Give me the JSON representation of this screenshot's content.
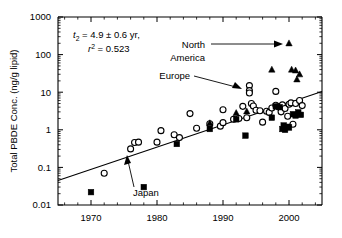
{
  "chart_data": {
    "type": "scatter",
    "title": "",
    "xlabel": "",
    "ylabel": "Total PBDE Conc. (ng/g lipid)",
    "xlim": [
      1965,
      2005
    ],
    "ylim": [
      0.01,
      1000
    ],
    "yscale": "log",
    "grid": false,
    "legend_position": "none",
    "xticks_major": [
      1970,
      1980,
      1990,
      2000
    ],
    "xticks_major_labels": [
      "1970",
      "1980",
      "1990",
      "2000"
    ],
    "xticks_minor_step": 2,
    "yticks_major": [
      0.01,
      0.1,
      1,
      10,
      100,
      1000
    ],
    "yticks_major_labels": [
      "0.01",
      "0.1",
      "1",
      "10",
      "100",
      "1000"
    ],
    "annotations": {
      "halflife_label": "t",
      "halflife_sub": "2",
      "halflife_value": " = 4.9 ± 0.6 yr,",
      "r2_label": "r",
      "r2_sup": "2",
      "r2_value": " = 0.523"
    },
    "callouts": [
      {
        "name": "north-america",
        "text_line1": "North",
        "text_line2": "America",
        "points_to_year": 2000,
        "points_to_value": 200
      },
      {
        "name": "europe",
        "text_line1": "Europe",
        "text_line2": "",
        "points_to_year": 1994,
        "points_to_value": 13
      },
      {
        "name": "japan",
        "text_line1": "Japan",
        "text_line2": "",
        "points_to_year": 1983,
        "points_to_value": 0.42
      }
    ],
    "fit_line": {
      "x": [
        1965,
        2005
      ],
      "y": [
        0.045,
        10.5
      ]
    },
    "series": [
      {
        "name": "Europe",
        "marker": "open-circle",
        "points": [
          [
            1972,
            0.07
          ],
          [
            1976,
            0.31
          ],
          [
            1976.6,
            0.46
          ],
          [
            1977.2,
            0.47
          ],
          [
            1980,
            0.47
          ],
          [
            1980.6,
            0.95
          ],
          [
            1982.6,
            0.74
          ],
          [
            1983.4,
            0.62
          ],
          [
            1985,
            2.7
          ],
          [
            1986,
            1.1
          ],
          [
            1988,
            1.45
          ],
          [
            1989.6,
            1.25
          ],
          [
            1990,
            1.55
          ],
          [
            1990,
            3.4
          ],
          [
            1991.6,
            1.9
          ],
          [
            1992.4,
            2.0
          ],
          [
            1993,
            4.2
          ],
          [
            1993.6,
            2.1
          ],
          [
            1994,
            15.0
          ],
          [
            1994,
            11.0
          ],
          [
            1994,
            9.5
          ],
          [
            1994.3,
            5.0
          ],
          [
            1994.6,
            4.3
          ],
          [
            1995,
            3.3
          ],
          [
            1995.6,
            3.2
          ],
          [
            1996,
            1.6
          ],
          [
            1996.6,
            3.1
          ],
          [
            1997,
            2.9
          ],
          [
            1997.4,
            3.8
          ],
          [
            1998,
            10.5
          ],
          [
            1998,
            4.5
          ],
          [
            1998.4,
            4.1
          ],
          [
            1998.8,
            3.0
          ],
          [
            1999,
            4.6
          ],
          [
            1999.4,
            3.7
          ],
          [
            1999.8,
            2.3
          ],
          [
            2000,
            4.8
          ],
          [
            2000.3,
            5.2
          ],
          [
            2000.6,
            1.4
          ],
          [
            2001,
            5.0
          ],
          [
            2001.6,
            6.0
          ],
          [
            2002,
            4.4
          ]
        ]
      },
      {
        "name": "Japan",
        "marker": "filled-square",
        "points": [
          [
            1970,
            0.022
          ],
          [
            1978,
            0.03
          ],
          [
            1983,
            0.42
          ],
          [
            1988,
            1.05
          ],
          [
            1992,
            1.9
          ],
          [
            1993.4,
            0.7
          ],
          [
            1997.4,
            2.1
          ],
          [
            1998,
            4.2
          ],
          [
            1998.6,
            4.0
          ],
          [
            1999,
            1.05
          ],
          [
            1999.2,
            1.3
          ],
          [
            1999.4,
            1.0
          ],
          [
            1999.8,
            1.2
          ],
          [
            2000,
            1.15
          ],
          [
            2000.6,
            2.6
          ],
          [
            2001,
            2.4
          ],
          [
            2001.4,
            2.9
          ],
          [
            2001.8,
            2.5
          ]
        ]
      },
      {
        "name": "North America",
        "marker": "filled-triangle",
        "points": [
          [
            1988,
            1.5
          ],
          [
            1992,
            2.8
          ],
          [
            1993.6,
            3.1
          ],
          [
            1997.4,
            40.0
          ],
          [
            2000,
            200.0
          ],
          [
            2000.4,
            40.0
          ],
          [
            2001,
            38.0
          ],
          [
            2001.2,
            22.0
          ],
          [
            2001.6,
            30.0
          ]
        ]
      }
    ]
  }
}
